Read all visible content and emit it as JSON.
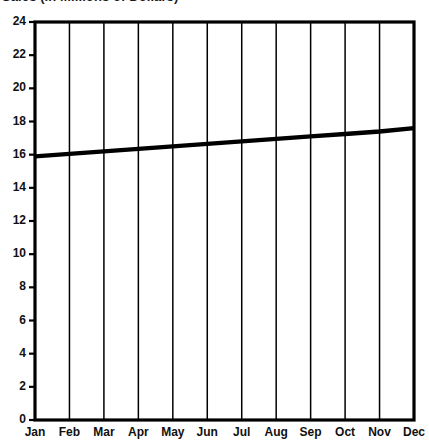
{
  "chart_data": {
    "type": "line",
    "title": "Sales (in Millions of Dollars)",
    "xlabel": "",
    "ylabel": "",
    "categories": [
      "Jan",
      "Feb",
      "Mar",
      "Apr",
      "May",
      "Jun",
      "Jul",
      "Aug",
      "Sep",
      "Oct",
      "Nov",
      "Dec"
    ],
    "series": [
      {
        "name": "Sales",
        "values": [
          15.9,
          16.05,
          16.2,
          16.35,
          16.5,
          16.65,
          16.8,
          16.95,
          17.1,
          17.25,
          17.4,
          17.6
        ]
      }
    ],
    "ylim": [
      0,
      24
    ],
    "ytick_labels": [
      "0",
      "2",
      "4",
      "6",
      "8",
      "10",
      "12",
      "14",
      "16",
      "18",
      "20",
      "22",
      "24"
    ],
    "ytick_values": [
      0,
      2,
      4,
      6,
      8,
      10,
      12,
      14,
      16,
      18,
      20,
      22,
      24
    ],
    "xtick_labels": [
      "Jan",
      "Feb",
      "Mar",
      "Apr",
      "May",
      "Jun",
      "Jul",
      "Aug",
      "Sep",
      "Oct",
      "Nov",
      "Dec"
    ],
    "grid": "vertical",
    "legend": "none",
    "line_color": "#000000",
    "background_color": "#ffffff",
    "axis_color": "#000000"
  }
}
